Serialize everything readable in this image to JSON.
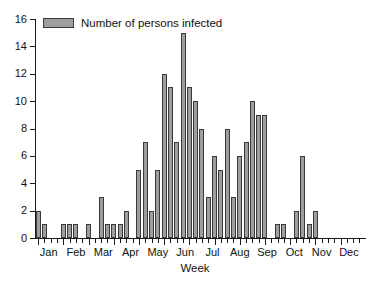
{
  "chart_data": {
    "type": "bar",
    "title": "",
    "xlabel": "Week",
    "ylabel": "",
    "ylim": [
      0,
      16
    ],
    "ytick_values": [
      0,
      2,
      4,
      6,
      8,
      10,
      12,
      14,
      16
    ],
    "ytick_labels": [
      "0",
      "2",
      "4",
      "6",
      "8",
      "10",
      "12",
      "14",
      "16"
    ],
    "grid": false,
    "legend_position": "top-left",
    "legend": [
      "Number of persons infected"
    ],
    "x_group_labels": [
      "Jan",
      "Feb",
      "Mar",
      "Apr",
      "May",
      "Jun",
      "Jul",
      "Aug",
      "Sep",
      "Oct",
      "Nov",
      "Dec"
    ],
    "x_description": "Week of year, grouped by month",
    "categories": [
      1,
      2,
      3,
      4,
      5,
      6,
      7,
      8,
      9,
      10,
      11,
      12,
      13,
      14,
      15,
      16,
      17,
      18,
      19,
      20,
      21,
      22,
      23,
      24,
      25,
      26,
      27,
      28,
      29,
      30,
      31,
      32,
      33,
      34,
      35,
      36,
      37,
      38,
      39,
      40,
      41,
      42,
      43,
      44,
      45,
      46,
      47,
      48,
      49,
      50,
      51,
      52
    ],
    "values": [
      2,
      1,
      0,
      0,
      1,
      1,
      1,
      0,
      1,
      0,
      3,
      1,
      1,
      1,
      2,
      0,
      5,
      7,
      2,
      5,
      12,
      11,
      7,
      15,
      11,
      10,
      8,
      3,
      6,
      5,
      8,
      3,
      6,
      7,
      10,
      9,
      9,
      0,
      1,
      1,
      0,
      2,
      6,
      1,
      2,
      0,
      0,
      0,
      0,
      0,
      0,
      0
    ],
    "series": [
      {
        "name": "Number of persons infected",
        "color": "#9e9e9e",
        "values": [
          2,
          1,
          0,
          0,
          1,
          1,
          1,
          0,
          1,
          0,
          3,
          1,
          1,
          1,
          2,
          0,
          5,
          7,
          2,
          5,
          12,
          11,
          7,
          15,
          11,
          10,
          8,
          3,
          6,
          5,
          8,
          3,
          6,
          7,
          10,
          9,
          9,
          0,
          1,
          1,
          0,
          2,
          6,
          1,
          2,
          0,
          0,
          0,
          0,
          0,
          0,
          0
        ]
      }
    ],
    "max_value": 15,
    "max_week": 24,
    "colors": {
      "bar_fill": "#9e9e9e",
      "bar_stroke": "#3a3a3a",
      "axis": "#1a1a1a",
      "background": "#ffffff"
    }
  }
}
